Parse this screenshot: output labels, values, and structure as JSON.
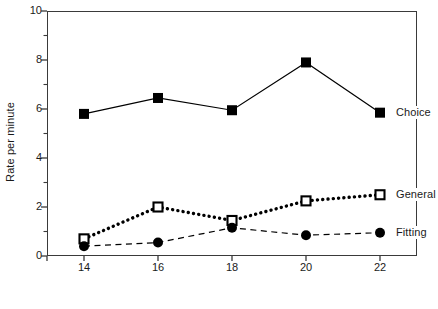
{
  "chart_data": {
    "type": "line",
    "title": "",
    "xlabel": "Age in months",
    "ylabel": "Rate per minute",
    "x": [
      14,
      16,
      18,
      20,
      22
    ],
    "categories": [
      "14",
      "16",
      "18",
      "20",
      "22"
    ],
    "xlim": [
      13,
      23
    ],
    "ylim": [
      0,
      10
    ],
    "ytick_labels": [
      "0",
      "2",
      "4",
      "6",
      "8",
      "10"
    ],
    "ytick_values": [
      0,
      2,
      4,
      6,
      8,
      10
    ],
    "yminor_values": [
      1,
      3,
      5,
      7,
      9
    ],
    "xtick_labels": [
      "14",
      "16",
      "18",
      "20",
      "22"
    ],
    "grid": false,
    "legend_position": "right-inline",
    "series": [
      {
        "name": "Choice",
        "values": [
          5.8,
          6.45,
          5.95,
          7.9,
          5.85
        ],
        "marker": "filled-square",
        "line_style": "solid",
        "color": "#000000"
      },
      {
        "name": "General",
        "values": [
          0.7,
          2.0,
          1.45,
          2.25,
          2.5
        ],
        "marker": "open-square",
        "line_style": "dotted",
        "color": "#000000"
      },
      {
        "name": "Fitting",
        "values": [
          0.4,
          0.55,
          1.15,
          0.85,
          0.95
        ],
        "marker": "filled-circle",
        "line_style": "dashed",
        "color": "#000000"
      }
    ]
  },
  "colors": {
    "axis": "#3a3a3a",
    "ink": "#000000",
    "background": "#ffffff"
  }
}
